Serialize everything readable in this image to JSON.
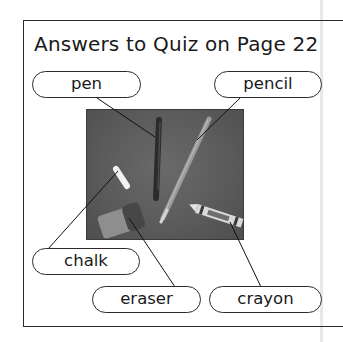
{
  "title": "Answers to Quiz on Page 22",
  "photo": {
    "description": "Photo of school supplies on a dark gray background",
    "background_color": "#5a5a5a",
    "objects": [
      "pen",
      "pencil",
      "chalk",
      "eraser",
      "crayon"
    ]
  },
  "labels": {
    "pen": "pen",
    "pencil": "pencil",
    "chalk": "chalk",
    "eraser": "eraser",
    "crayon": "crayon"
  },
  "colors": {
    "border": "#2a2a2a",
    "text": "#1a1a1a",
    "background": "#ffffff"
  }
}
